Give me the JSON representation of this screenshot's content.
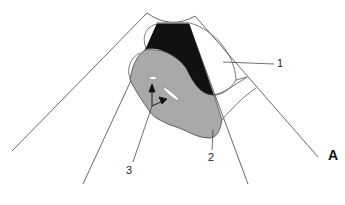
{
  "figure": {
    "panel_label": "A",
    "labels": [
      {
        "id": "1",
        "text": "1"
      },
      {
        "id": "2",
        "text": "2"
      },
      {
        "id": "3",
        "text": "3"
      }
    ],
    "colors": {
      "outline": "#333333",
      "dark_region": "#111111",
      "gray_region": "#a9a9a9",
      "lumen": "#ffffff",
      "background": "#ffffff"
    }
  }
}
